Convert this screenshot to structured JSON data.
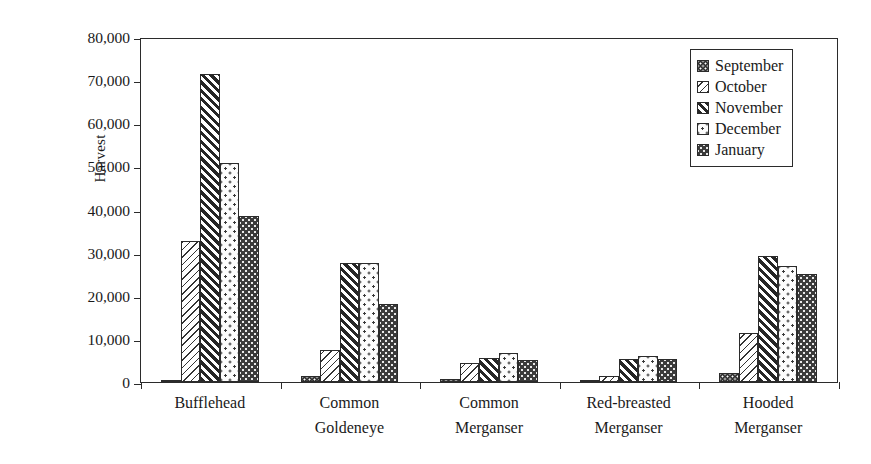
{
  "chart_data": {
    "type": "bar",
    "title": "",
    "xlabel": "",
    "ylabel": "Harvest",
    "ylim": [
      0,
      80000
    ],
    "yticks": [
      0,
      10000,
      20000,
      30000,
      40000,
      50000,
      60000,
      70000,
      80000
    ],
    "ytick_labels": [
      "0",
      "10,000",
      "20,000",
      "30,000",
      "40,000",
      "50,000",
      "60,000",
      "70,000",
      "80,000"
    ],
    "grid": false,
    "legend_position": "top-right",
    "categories": [
      "Bufflehead",
      "Common Goldeneye",
      "Common Merganser",
      "Red-breasted Merganser",
      "Hooded Merganser"
    ],
    "category_label_lines": [
      [
        "Bufflehead",
        ""
      ],
      [
        "Common",
        "Goldeneye"
      ],
      [
        "Common",
        "Merganser"
      ],
      [
        "Red-breasted",
        "Merganser"
      ],
      [
        "Hooded",
        "Merganser"
      ]
    ],
    "series": [
      {
        "name": "September",
        "pattern": "sep",
        "values": [
          400,
          1500,
          700,
          150,
          2000
        ]
      },
      {
        "name": "October",
        "pattern": "oct",
        "values": [
          32700,
          7500,
          4300,
          1300,
          11300
        ]
      },
      {
        "name": "November",
        "pattern": "nov",
        "values": [
          71500,
          27700,
          5500,
          5300,
          29300
        ]
      },
      {
        "name": "December",
        "pattern": "dec",
        "values": [
          50700,
          27500,
          6800,
          6000,
          27000
        ]
      },
      {
        "name": "January",
        "pattern": "jan",
        "values": [
          38500,
          18000,
          5000,
          5400,
          25000
        ]
      }
    ]
  },
  "legend": {
    "items": [
      {
        "label": "September",
        "pattern": "sep"
      },
      {
        "label": "October",
        "pattern": "oct"
      },
      {
        "label": "November",
        "pattern": "nov"
      },
      {
        "label": "December",
        "pattern": "dec"
      },
      {
        "label": "January",
        "pattern": "jan"
      }
    ]
  },
  "colors": {
    "axis": "#2b2b2b",
    "fill_dark": "#2e2e2e",
    "fill_light": "#ffffff",
    "background": "#ffffff"
  }
}
